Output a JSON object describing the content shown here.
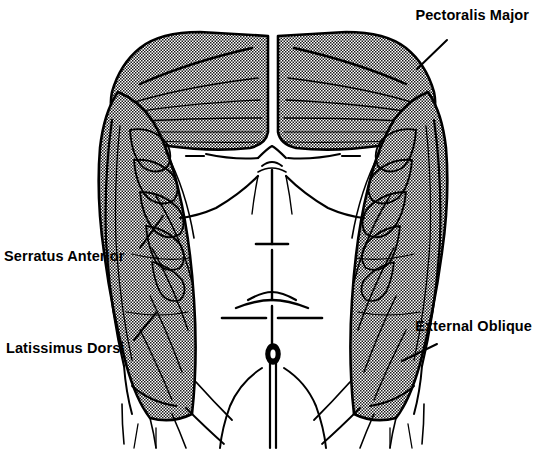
{
  "figure": {
    "view": "anterior",
    "background_color": "#ffffff",
    "ink_color": "#000000",
    "shading_color": "#8a8a8a",
    "caption_fragment": "g"
  },
  "labels": [
    {
      "id": "pectoralis-major",
      "text": "Pectoralis Major",
      "side": "right",
      "leader": {
        "from_x": 447,
        "from_y": 40,
        "to_x": 417,
        "to_y": 69
      }
    },
    {
      "id": "serratus-anterior",
      "text": "Serratus Anterior",
      "side": "left",
      "leader": {
        "from_x": 140,
        "from_y": 248,
        "to_x": 163,
        "to_y": 216
      }
    },
    {
      "id": "latissimus-dorsi",
      "text": "Latissimus Dorsi",
      "side": "left",
      "leader": {
        "from_x": 134,
        "from_y": 340,
        "to_x": 156,
        "to_y": 313
      }
    },
    {
      "id": "external-oblique",
      "text": "External Oblique",
      "side": "right",
      "leader": {
        "from_x": 437,
        "from_y": 344,
        "to_x": 402,
        "to_y": 361
      }
    }
  ],
  "muscles": [
    {
      "id": "pectoralis-major-left",
      "name": "Pectoralis Major (left)",
      "shaded": true
    },
    {
      "id": "pectoralis-major-right",
      "name": "Pectoralis Major (right)",
      "shaded": true
    },
    {
      "id": "serratus-anterior-left",
      "name": "Serratus Anterior (left)",
      "shaded": true
    },
    {
      "id": "serratus-anterior-right",
      "name": "Serratus Anterior (right)",
      "shaded": true
    },
    {
      "id": "latissimus-dorsi-left",
      "name": "Latissimus Dorsi (left)",
      "shaded": true
    },
    {
      "id": "latissimus-dorsi-right",
      "name": "Latissimus Dorsi (right)",
      "shaded": true
    },
    {
      "id": "external-oblique-left",
      "name": "External Oblique (left)",
      "shaded": true
    },
    {
      "id": "external-oblique-right",
      "name": "External Oblique (right)",
      "shaded": true
    },
    {
      "id": "rectus-abdominis",
      "name": "Rectus Abdominis",
      "shaded": false
    },
    {
      "id": "linea-alba",
      "name": "Linea Alba",
      "shaded": false
    },
    {
      "id": "umbilicus",
      "name": "Umbilicus",
      "shaded": false
    }
  ]
}
